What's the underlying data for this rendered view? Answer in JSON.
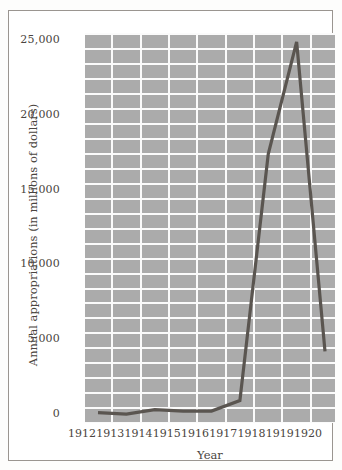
{
  "chart_data": {
    "type": "line",
    "title": "",
    "subtitle": "",
    "xlabel": "Year",
    "ylabel": "Annual appropriations (in millions of dollars)",
    "categories": [
      "1912",
      "1913",
      "1914",
      "1915",
      "1916",
      "1917",
      "1918",
      "1919",
      "1920"
    ],
    "x": [
      1912,
      1913,
      1914,
      1915,
      1916,
      1917,
      1918,
      1919,
      1920
    ],
    "values": [
      700,
      600,
      900,
      800,
      800,
      1500,
      18000,
      25500,
      4800
    ],
    "series": [
      {
        "name": "Annual appropriations",
        "values": [
          700,
          600,
          900,
          800,
          800,
          1500,
          18000,
          25500,
          4800
        ]
      }
    ],
    "ylim": [
      0,
      26100
    ],
    "xlim": [
      1912,
      1920
    ],
    "ytick_labels": [
      "0",
      "5,000",
      "10,000",
      "15,000",
      "20,000",
      "25,000"
    ],
    "ytick_values": [
      0,
      5000,
      10000,
      15000,
      20000,
      25000
    ],
    "xtick_labels": [
      "1912",
      "1913",
      "1914",
      "1915",
      "1916",
      "1917",
      "1918",
      "1919",
      "1920"
    ],
    "grid": true,
    "grid_minor_step": 1000,
    "legend": null,
    "legend_position": "none",
    "annotations": [],
    "colors": {
      "line": "#5a5550",
      "plot_background": "#ababab",
      "gridline": "#fbfbfb",
      "text": "#4a4540",
      "frame": "#9a9590",
      "figure_background": "#ffffff"
    }
  }
}
